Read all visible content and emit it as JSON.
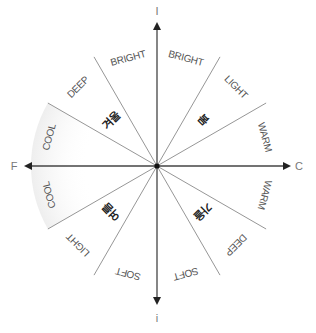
{
  "diagram": {
    "center": {
      "x": 157,
      "y": 166
    },
    "radius": 126,
    "axes": {
      "top": "I",
      "bottom": "i",
      "left": "F",
      "right": "C"
    },
    "spoke_angles_deg_from_horizontal": [
      30,
      60
    ],
    "ring_labels": [
      {
        "text": "BRIGHT",
        "angle": 15
      },
      {
        "text": "LIGHT",
        "angle": 45
      },
      {
        "text": "WARM",
        "angle": 75
      },
      {
        "text": "WARM",
        "angle": 105
      },
      {
        "text": "DEEP",
        "angle": 135
      },
      {
        "text": "SOFT",
        "angle": 165
      },
      {
        "text": "SOFT",
        "angle": 195
      },
      {
        "text": "LIGHT",
        "angle": 225
      },
      {
        "text": "COOL",
        "angle": 255
      },
      {
        "text": "COOL",
        "angle": 285
      },
      {
        "text": "DEEP",
        "angle": 315
      },
      {
        "text": "BRIGHT",
        "angle": 345
      }
    ],
    "season_labels": [
      {
        "text": "봄",
        "angle": 45
      },
      {
        "text": "가을",
        "angle": 135
      },
      {
        "text": "여름",
        "angle": 225
      },
      {
        "text": "겨울",
        "angle": 315
      }
    ],
    "colors": {
      "axis": "#444444",
      "spoke": "#8a8a8a",
      "ring_text": "#555555",
      "season_text": "#222222",
      "cool_tint": "#f0f0f0"
    }
  }
}
